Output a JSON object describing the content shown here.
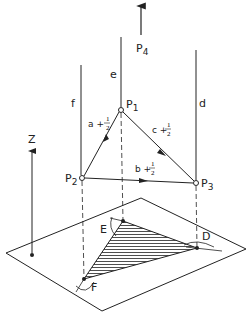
{
  "diagram": {
    "points": {
      "P1": {
        "label": "P",
        "sub": "1"
      },
      "P2": {
        "label": "P",
        "sub": "2"
      },
      "P3": {
        "label": "P",
        "sub": "3"
      },
      "P4": {
        "label": "P",
        "sub": "4"
      }
    },
    "lines": {
      "e": "e",
      "f": "f",
      "d": "d"
    },
    "edges": {
      "a": {
        "prefix": "a +",
        "num": "1",
        "den": "2"
      },
      "b": {
        "prefix": "b +",
        "num": "1",
        "den": "2"
      },
      "c": {
        "prefix": "c +",
        "num": "1",
        "den": "2"
      }
    },
    "projected": {
      "E": "E",
      "D": "D",
      "F": "F"
    },
    "axis": {
      "z": "Z"
    },
    "colors": {
      "ink": "#222222",
      "background": "#ffffff"
    }
  }
}
